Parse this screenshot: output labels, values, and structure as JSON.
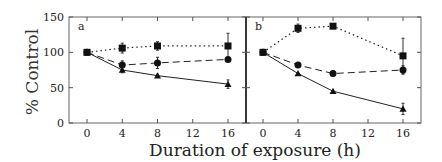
{
  "chart_data": {
    "type": "line",
    "ylabel": "% Control",
    "xlabel": "Duration of exposure (h)",
    "ylim": [
      0,
      150
    ],
    "yticks": [
      0,
      50,
      100,
      150
    ],
    "xticks": [
      0,
      4,
      8,
      12,
      16
    ],
    "panels": [
      {
        "label": "a",
        "x": [
          0,
          4,
          8,
          16
        ],
        "series": [
          {
            "name": "squares (dotted)",
            "marker": "square",
            "line": "dotted",
            "values": [
              100,
              106,
              109,
              109
            ],
            "errors": [
              0,
              7,
              6,
              18
            ]
          },
          {
            "name": "circles (dashed)",
            "marker": "circle",
            "line": "dashed",
            "values": [
              100,
              82,
              85,
              90
            ],
            "errors": [
              0,
              6,
              8,
              0
            ]
          },
          {
            "name": "triangles (solid)",
            "marker": "triangle",
            "line": "solid",
            "values": [
              100,
              75,
              67,
              55
            ],
            "errors": [
              0,
              4,
              2,
              6
            ]
          }
        ]
      },
      {
        "label": "b",
        "x": [
          0,
          4,
          8,
          16
        ],
        "series": [
          {
            "name": "squares (dotted)",
            "marker": "square",
            "line": "dotted",
            "values": [
              100,
              134,
              137,
              95
            ],
            "errors": [
              0,
              6,
              0,
              25
            ]
          },
          {
            "name": "circles (dashed)",
            "marker": "circle",
            "line": "dashed",
            "values": [
              100,
              82,
              70,
              75
            ],
            "errors": [
              0,
              0,
              0,
              6
            ]
          },
          {
            "name": "triangles (solid)",
            "marker": "triangle",
            "line": "solid",
            "values": [
              100,
              70,
              45,
              20
            ],
            "errors": [
              0,
              0,
              0,
              8
            ]
          }
        ]
      }
    ],
    "grid": false,
    "legend": "none"
  },
  "labels": {
    "ylabel": "% Control",
    "xlabel": "Duration of exposure (h)",
    "panel_a": "a",
    "panel_b": "b",
    "yticks": [
      "0",
      "50",
      "100",
      "150"
    ],
    "xticks": [
      "0",
      "4",
      "8",
      "12",
      "16"
    ]
  }
}
